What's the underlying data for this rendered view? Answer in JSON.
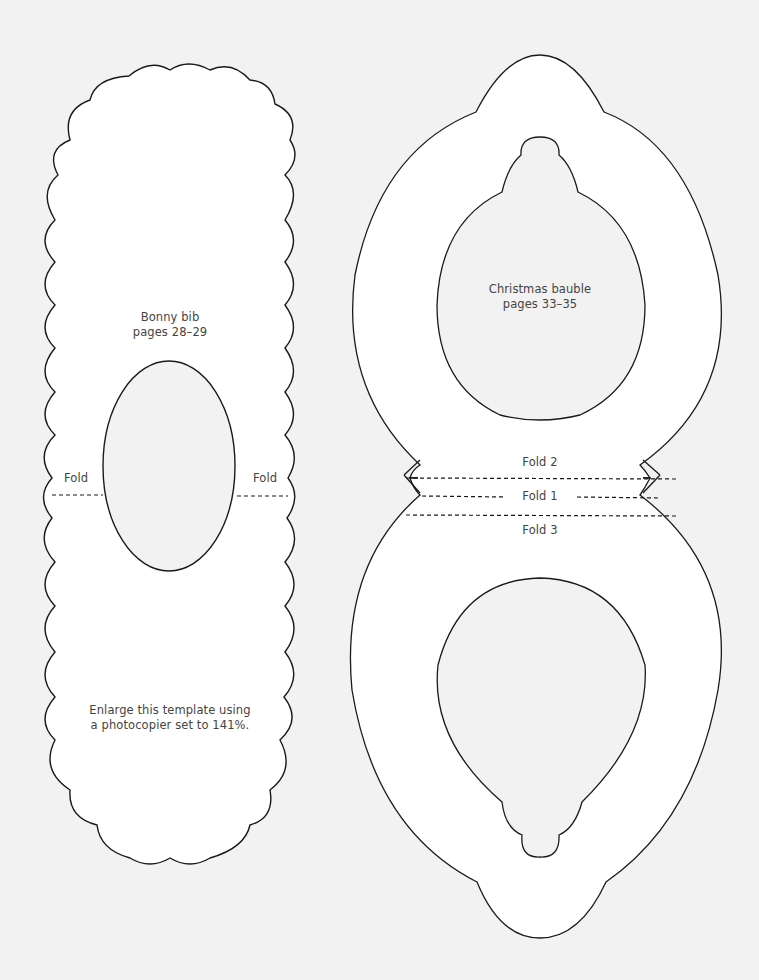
{
  "page": {
    "background": "#f2f2f2",
    "line_color": "#1a1a1a",
    "text_color": "#444444"
  },
  "bib": {
    "title": "Bonny bib",
    "pages": "pages 28–29",
    "fold_left": "Fold",
    "fold_right": "Fold",
    "instruction_line1": "Enlarge this template using",
    "instruction_line2": "a photocopier set to 141%."
  },
  "bauble": {
    "title": "Christmas bauble",
    "pages": "pages 33–35",
    "fold1": "Fold 1",
    "fold2": "Fold 2",
    "fold3": "Fold 3"
  }
}
